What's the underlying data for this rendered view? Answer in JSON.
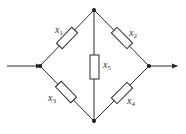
{
  "diagram": {
    "type": "bridge-network",
    "components": [
      {
        "id": "x1",
        "label": "x",
        "subscript": "1",
        "edge": "left-top"
      },
      {
        "id": "x2",
        "label": "x",
        "subscript": "2",
        "edge": "top-right"
      },
      {
        "id": "x3",
        "label": "x",
        "subscript": "3",
        "edge": "left-bottom"
      },
      {
        "id": "x4",
        "label": "x",
        "subscript": "4",
        "edge": "bottom-right"
      },
      {
        "id": "x5",
        "label": "x",
        "subscript": "5",
        "edge": "top-bottom"
      }
    ],
    "nodes": [
      "left",
      "top",
      "right",
      "bottom"
    ],
    "input": "arrow into left node",
    "output": "arrow out of right node",
    "colors": {
      "line": "#2a2a2a",
      "node": "#1a1a1a",
      "background": "#ffffff"
    }
  }
}
